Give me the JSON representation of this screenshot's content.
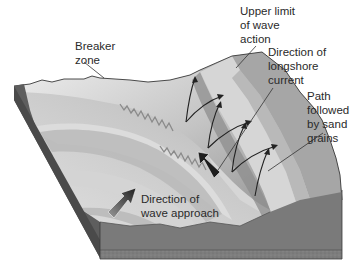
{
  "diagram": {
    "type": "block-diagram",
    "labels": {
      "breaker_zone": "Breaker\nzone",
      "upper_limit": "Upper limit\nof wave\naction",
      "longshore_current": "Direction of\nlongshore\ncurrent",
      "sand_path": "Path\nfollowed\nby sand\ngrains",
      "wave_approach": "Direction of\nwave approach"
    },
    "colors": {
      "background": "#ffffff",
      "side_face_left": "#5e5e5e",
      "side_face_front": "#7a7a7a",
      "bottom_edge": "#8c8c8c",
      "wave_crest": "#d8d8d8",
      "wave_trough": "#a9a9a9",
      "beach_light": "#cfcfcf",
      "beach_mid": "#b5b5b5",
      "beach_upper": "#9e9e9e",
      "outline": "#3a3a3a",
      "text": "#2a2a2a"
    }
  }
}
